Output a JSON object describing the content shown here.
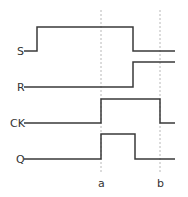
{
  "diagram": {
    "type": "timing-diagram",
    "signals": [
      {
        "name": "S",
        "edges": [
          {
            "at": "start",
            "level": 0
          },
          {
            "at": 0.2,
            "level": 1
          },
          {
            "at": 0.8,
            "level": 0
          }
        ]
      },
      {
        "name": "R",
        "edges": [
          {
            "at": "start",
            "level": 0
          },
          {
            "at": 0.8,
            "level": 1
          }
        ]
      },
      {
        "name": "CK",
        "edges": [
          {
            "at": "start",
            "level": 0
          },
          {
            "at": "a",
            "level": 1
          },
          {
            "at": "b",
            "level": 0
          }
        ]
      },
      {
        "name": "Q",
        "edges": [
          {
            "at": "start",
            "level": 0
          },
          {
            "at": "a",
            "level": 1
          },
          {
            "at": 0.82,
            "level": 0
          }
        ]
      }
    ],
    "markers": [
      {
        "name": "a"
      },
      {
        "name": "b"
      }
    ],
    "colors": {
      "wave": "#3a3a3a",
      "marker": "#b8b8b8",
      "text": "#333333"
    }
  }
}
